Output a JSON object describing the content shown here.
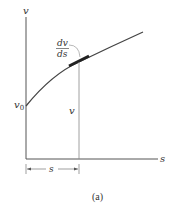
{
  "diagram": {
    "axes": {
      "y_label": "v",
      "x_label": "s",
      "y_intercept_label": "v",
      "y_intercept_sub": "0"
    },
    "curve": {
      "slope_label_num": "dv",
      "slope_label_den": "ds"
    },
    "vertical_line_label": "v",
    "dimension_label": "s",
    "caption": "(a)",
    "colors": {
      "ink": "#333333",
      "curve": "#444444",
      "highlight": "#222222",
      "thin_line": "#777777"
    }
  }
}
